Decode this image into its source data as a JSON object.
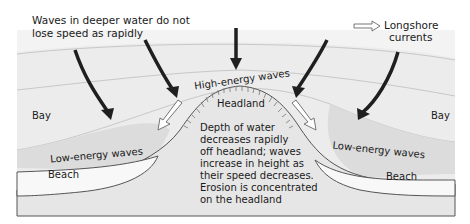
{
  "diagram": {
    "labels": {
      "deeper_water_line1": "Waves in deeper water do not",
      "deeper_water_line2": "lose speed as rapidly",
      "legend_arrow_label_line1": "Longshore",
      "legend_arrow_label_line2": "currents",
      "high_energy": "High-energy waves",
      "headland": "Headland",
      "bay_left": "Bay",
      "bay_right": "Bay",
      "low_energy_left": "Low-energy waves",
      "low_energy_right": "Low-energy waves",
      "beach_left": "Beach",
      "beach_right": "Beach",
      "note_line1": "Depth of water",
      "note_line2": "decreases rapidly",
      "note_line3": "off headland; waves",
      "note_line4": "increase in height as",
      "note_line5": "their speed decreases.",
      "note_line6": "Erosion is concentrated",
      "note_line7": "on the headland"
    },
    "legend": [
      {
        "icon": "hollow-arrow-icon",
        "meaning": "Longshore currents"
      }
    ],
    "colors": {
      "sea": "#e9e9e9",
      "sea_near_shore": "#d9d9d9",
      "headland": "#e4e4e4",
      "beach": "#f7f7f7",
      "arrow": "#1f1f1f",
      "wave_line": "#c8c8c8"
    }
  }
}
